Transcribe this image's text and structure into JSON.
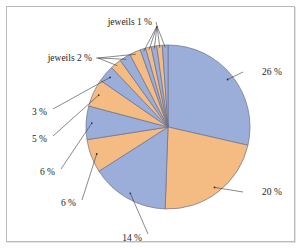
{
  "figure": {
    "title": "",
    "background": "#ffffff",
    "frame_color": "#b9b9b9"
  },
  "colors": {
    "blue": "#9BAEDA",
    "orange": "#F4BC82",
    "slice_edge": "#6D6F86",
    "leader_line": "#3A3A3A",
    "label_text": "#1C1C1C"
  },
  "labels": {
    "p26": "26 %",
    "p20": "20 %",
    "p14": "14 %",
    "p6a": "6 %",
    "p6b": "6 %",
    "p5": "5 %",
    "p3": "3 %",
    "jeweils2": "jeweils 2 %",
    "jeweils1": "jeweils 1 %"
  },
  "chart_data": {
    "type": "pie",
    "title": "",
    "start_angle_deg": 0,
    "direction": "clockwise",
    "total_percent": 100,
    "legend": "none",
    "grid": false,
    "categories": [
      "26 %",
      "20 %",
      "14 %",
      "6 %",
      "6 %",
      "5 %",
      "3 %",
      "2 %",
      "2 %",
      "2 %",
      "1 %",
      "1 %",
      "1 %",
      "1 %",
      "1 %"
    ],
    "values": [
      26,
      20,
      14,
      6,
      6,
      5,
      3,
      2,
      2,
      2,
      1,
      1,
      1,
      1,
      1
    ],
    "colors": [
      "#9BAEDA",
      "#F4BC82",
      "#9BAEDA",
      "#F4BC82",
      "#9BAEDA",
      "#F4BC82",
      "#9BAEDA",
      "#F4BC82",
      "#9BAEDA",
      "#F4BC82",
      "#9BAEDA",
      "#F4BC82",
      "#9BAEDA",
      "#F4BC82",
      "#9BAEDA"
    ],
    "labelled_slices": [
      {
        "index": 0,
        "text": "26 %",
        "side": "right"
      },
      {
        "index": 1,
        "text": "20 %",
        "side": "right"
      },
      {
        "index": 2,
        "text": "14 %",
        "side": "bottom"
      },
      {
        "index": 3,
        "text": "6 %",
        "side": "left"
      },
      {
        "index": 4,
        "text": "6 %",
        "side": "left"
      },
      {
        "index": 5,
        "text": "5 %",
        "side": "left"
      },
      {
        "index": 6,
        "text": "3 %",
        "side": "left"
      },
      {
        "index": 7,
        "text": "jeweils 2 %",
        "side": "upper-left",
        "groups": 3
      },
      {
        "index": 10,
        "text": "jeweils 1 %",
        "side": "top",
        "groups": 5
      }
    ]
  },
  "geometry": {
    "center_x": 168,
    "center_y": 127,
    "radius": 82
  }
}
